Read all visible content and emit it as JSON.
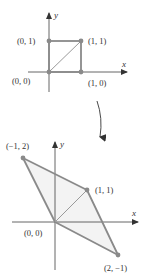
{
  "colors": {
    "axis": "#555555",
    "shape_stroke": "#8a8a8a",
    "point": "#8a8a8a",
    "fill": "#f3f3f3",
    "text": "#333333"
  },
  "top_figure": {
    "axis_labels": {
      "x": "x",
      "y": "y"
    },
    "points": [
      {
        "id": "origin",
        "coords": [
          0,
          0
        ],
        "label": "(0, 0)"
      },
      {
        "id": "e1",
        "coords": [
          1,
          0
        ],
        "label": "(1, 0)"
      },
      {
        "id": "e2",
        "coords": [
          0,
          1
        ],
        "label": "(0, 1)"
      },
      {
        "id": "corner",
        "coords": [
          1,
          1
        ],
        "label": "(1, 1)"
      }
    ],
    "shape": "unit square with diagonal"
  },
  "transform_arrow": {
    "icon": "curved-arrow-down-icon"
  },
  "bottom_figure": {
    "axis_labels": {
      "x": "x",
      "y": "y"
    },
    "points": [
      {
        "id": "origin",
        "coords": [
          0,
          0
        ],
        "label": "(0, 0)"
      },
      {
        "id": "image-e2",
        "coords": [
          -1,
          2
        ],
        "label": "(−1, 2)"
      },
      {
        "id": "image-corner",
        "coords": [
          1,
          1
        ],
        "label": "(1, 1)"
      },
      {
        "id": "image-e1",
        "coords": [
          2,
          -1
        ],
        "label": "(2, −1)"
      }
    ],
    "shape": "parallelogram with diagonal"
  }
}
